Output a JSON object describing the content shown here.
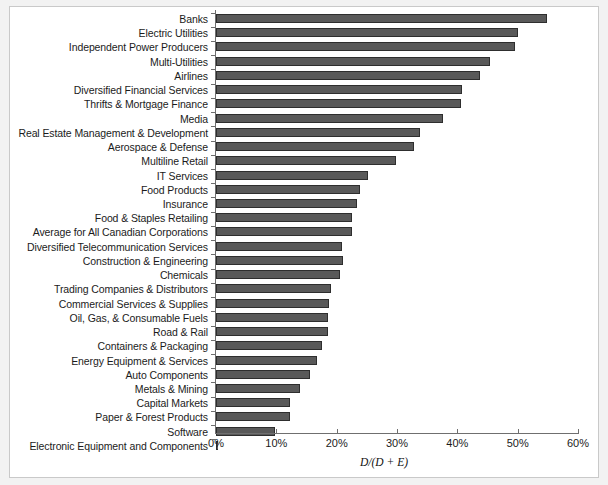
{
  "chart_data": {
    "type": "bar",
    "orientation": "horizontal",
    "title": "",
    "subtitle": "",
    "xlabel": "D/(D + E)",
    "ylabel": "",
    "xlim": [
      0,
      60
    ],
    "xunit": "%",
    "xticks": [
      0,
      10,
      20,
      30,
      40,
      50,
      60
    ],
    "xtick_labels": [
      "0%",
      "10%",
      "20%",
      "30%",
      "40%",
      "50%",
      "60%"
    ],
    "grid": false,
    "legend": null,
    "bar_color": "#595959",
    "bar_edge_color": "#2e2e2e",
    "background_color": "#ffffff",
    "frame_color": "#c9c9c9",
    "categories": [
      "Banks",
      "Electric Utilities",
      "Independent Power Producers",
      "Multi-Utilities",
      "Airlines",
      "Diversified Financial Services",
      "Thrifts & Mortgage Finance",
      "Media",
      "Real Estate Management & Development",
      "Aerospace & Defense",
      "Multiline Retail",
      "IT Services",
      "Food Products",
      "Insurance",
      "Food & Staples Retailing",
      "Average for All Canadian Corporations",
      "Diversified Telecommunication Services",
      "Construction & Engineering",
      "Chemicals",
      "Trading Companies & Distributors",
      "Commercial Services & Supplies",
      "Oil, Gas, & Consumable Fuels",
      "Road & Rail",
      "Containers & Packaging",
      "Energy Equipment & Services",
      "Auto Components",
      "Metals & Mining",
      "Capital Markets",
      "Paper & Forest Products",
      "Software",
      "Electronic Equipment and Components"
    ],
    "values": [
      54.9,
      50.0,
      49.6,
      45.4,
      43.8,
      40.8,
      40.6,
      37.6,
      33.8,
      32.8,
      29.8,
      25.2,
      23.9,
      23.4,
      22.6,
      22.5,
      20.9,
      21.0,
      20.6,
      19.1,
      18.7,
      18.6,
      18.6,
      17.6,
      16.7,
      15.6,
      13.9,
      12.3,
      12.3,
      9.8,
      0.3
    ]
  }
}
